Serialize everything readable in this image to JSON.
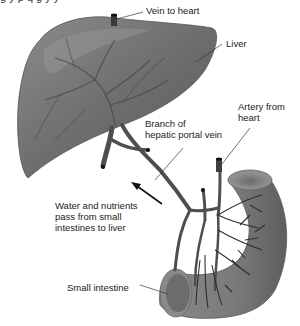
{
  "diagram": {
    "colors": {
      "organ_fill": "#7a7a7a",
      "organ_highlight": "#a8a8a8",
      "organ_shadow": "#4a4a4a",
      "vessel": "#4e4e4e",
      "vessel_dark": "#2a2a2a",
      "label_text": "#222222",
      "leader_line": "#333333",
      "background": "#ffffff"
    },
    "labels": {
      "vein_to_heart": "Vein to heart",
      "liver": "Liver",
      "artery_from_heart": "Artery from\nheart",
      "branch_portal_vein": "Branch of\nhepatic portal vein",
      "water_nutrients": "Water and nutrients\npass from small\nintestines to liver",
      "small_intestine": "Small intestine"
    },
    "cut_off_caption": "g y p q g y y"
  }
}
